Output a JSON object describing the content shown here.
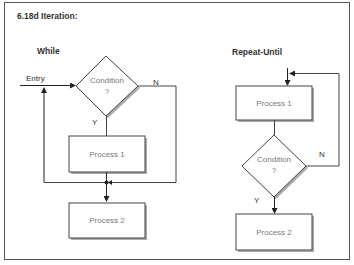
{
  "title": "6.18d Iteration:",
  "while": {
    "heading": "While",
    "entry_label": "Entry",
    "condition_line1": "Condition",
    "condition_line2": "?",
    "yes_label": "Y",
    "no_label": "N",
    "process1": "Process 1",
    "process2": "Process 2"
  },
  "repeat_until": {
    "heading": "Repeat-Until",
    "process1": "Process 1",
    "condition_line1": "Condition",
    "condition_line2": "?",
    "yes_label": "Y",
    "no_label": "N",
    "process2": "Process 2"
  },
  "colors": {
    "line": "#333333",
    "node_border": "#444444",
    "node_shadow": "#999999",
    "node_text": "#777777"
  }
}
